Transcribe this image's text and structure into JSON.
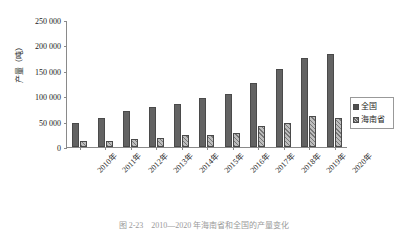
{
  "chart_data": {
    "type": "bar",
    "title": "",
    "xlabel": "",
    "ylabel": "产量（吨）",
    "ylim": [
      0,
      250000
    ],
    "ytick_step": 50000,
    "ytick_labels": [
      "250 000",
      "200 000",
      "150 000",
      "100 000",
      "50 000",
      "0"
    ],
    "ytick_values": [
      250000,
      200000,
      150000,
      100000,
      50000,
      0
    ],
    "grid": false,
    "legend_position": "right",
    "categories": [
      "2010年",
      "2011年",
      "2012年",
      "2013年",
      "2014年",
      "2015年",
      "2016年",
      "2017年",
      "2018年",
      "2019年",
      "2020年"
    ],
    "series": [
      {
        "name": "全国",
        "color": "#636363",
        "pattern": "solid",
        "values": [
          47000,
          57000,
          70000,
          79000,
          85000,
          96000,
          104000,
          126000,
          153000,
          176000,
          184000
        ]
      },
      {
        "name": "海南省",
        "color": "#bdbdbd",
        "pattern": "diagonal-hatch",
        "values": [
          11000,
          12000,
          15000,
          17000,
          23000,
          24000,
          28000,
          41000,
          48000,
          61000,
          58000
        ]
      }
    ]
  },
  "legend": {
    "items": [
      {
        "label": "全国",
        "swatch": "solid-dark-square"
      },
      {
        "label": "海南省",
        "swatch": "hatched-square"
      }
    ]
  },
  "caption": {
    "text": "图 2-23　2010—2020 年海南省和全国的产量变化"
  }
}
